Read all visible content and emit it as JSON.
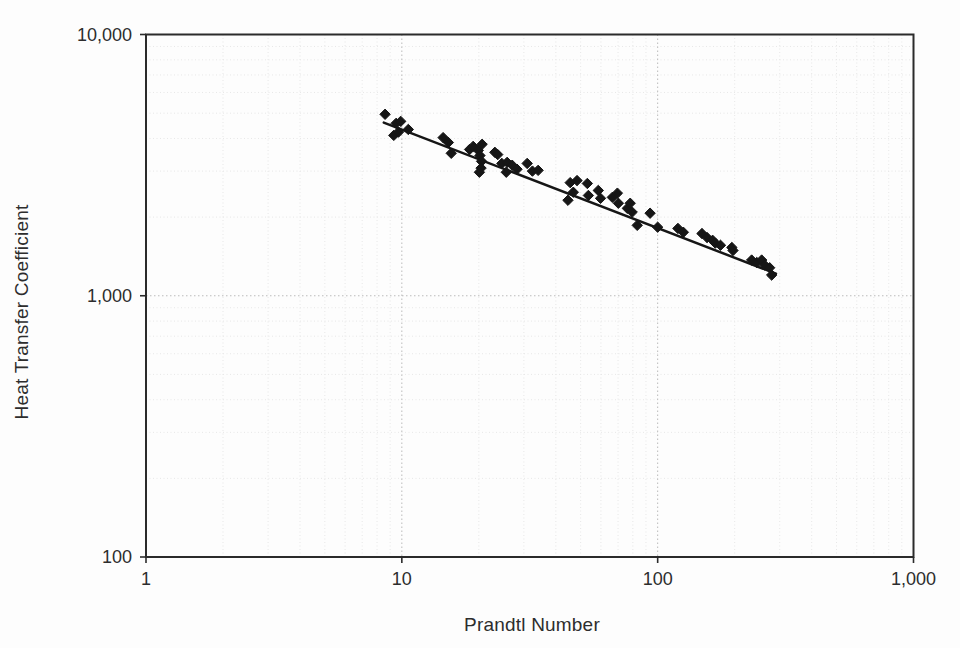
{
  "figure": {
    "background_color": "#fdfdfd",
    "text_color": "#2d2d2d"
  },
  "chart_data": {
    "type": "scatter",
    "title": "",
    "xlabel": "Prandtl Number",
    "ylabel": "Heat Transfer Coefficient",
    "x_scale": "log",
    "y_scale": "log",
    "xlim": [
      1,
      1000
    ],
    "ylim": [
      100,
      10000
    ],
    "grid": "on",
    "legend": "none",
    "x_ticks": [
      {
        "value": 1,
        "label": "1"
      },
      {
        "value": 10,
        "label": "10"
      },
      {
        "value": 100,
        "label": "100"
      },
      {
        "value": 1000,
        "label": "1,000"
      }
    ],
    "y_ticks": [
      {
        "value": 100,
        "label": "100"
      },
      {
        "value": 1000,
        "label": "1,000"
      },
      {
        "value": 10000,
        "label": "10,000"
      }
    ],
    "marker": "diamond",
    "marker_color": "#161616",
    "line_color": "#161616",
    "minor_grid_color": "#e7e7e7",
    "major_grid_color": "#bbbbbb",
    "border_color": "#2b2b2b",
    "trendline": {
      "x1": 8.5,
      "y1": 4600,
      "x2": 290,
      "y2": 1215
    },
    "points": [
      [
        8.6,
        4950
      ],
      [
        9.3,
        4110
      ],
      [
        9.5,
        4570
      ],
      [
        9.9,
        4650
      ],
      [
        9.7,
        4230
      ],
      [
        10.6,
        4330
      ],
      [
        14.5,
        4030
      ],
      [
        15.2,
        3860
      ],
      [
        15.6,
        3510
      ],
      [
        18.4,
        3630
      ],
      [
        19.0,
        3730
      ],
      [
        19.9,
        3600
      ],
      [
        20.2,
        3440
      ],
      [
        20.5,
        3270
      ],
      [
        20.4,
        3080
      ],
      [
        20.1,
        2970
      ],
      [
        20.6,
        3800
      ],
      [
        23.1,
        3540
      ],
      [
        23.7,
        3470
      ],
      [
        24.6,
        3210
      ],
      [
        25.6,
        2970
      ],
      [
        25.8,
        3240
      ],
      [
        27.0,
        3160
      ],
      [
        28.2,
        3050
      ],
      [
        30.9,
        3210
      ],
      [
        32.4,
        3000
      ],
      [
        34.1,
        3020
      ],
      [
        44.6,
        2320
      ],
      [
        45.5,
        2710
      ],
      [
        46.8,
        2490
      ],
      [
        48.4,
        2760
      ],
      [
        53.1,
        2690
      ],
      [
        53.6,
        2420
      ],
      [
        58.6,
        2530
      ],
      [
        59.8,
        2360
      ],
      [
        66.5,
        2380
      ],
      [
        69.6,
        2470
      ],
      [
        70.2,
        2260
      ],
      [
        76.1,
        2160
      ],
      [
        78.1,
        2260
      ],
      [
        79.5,
        2090
      ],
      [
        83.2,
        1860
      ],
      [
        93.4,
        2070
      ],
      [
        100,
        1830
      ],
      [
        120,
        1810
      ],
      [
        126,
        1750
      ],
      [
        149,
        1730
      ],
      [
        156,
        1670
      ],
      [
        164,
        1630
      ],
      [
        168,
        1590
      ],
      [
        176,
        1560
      ],
      [
        195,
        1530
      ],
      [
        197,
        1490
      ],
      [
        233,
        1370
      ],
      [
        244,
        1340
      ],
      [
        255,
        1370
      ],
      [
        262,
        1310
      ],
      [
        274,
        1280
      ],
      [
        279,
        1200
      ]
    ]
  }
}
